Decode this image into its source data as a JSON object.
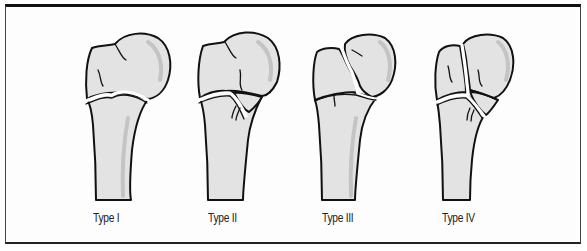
{
  "figure": {
    "types": [
      {
        "label": "Type I"
      },
      {
        "label": "Type II"
      },
      {
        "label": "Type III"
      },
      {
        "label": "Type IV"
      }
    ]
  },
  "colors": {
    "bone_fill": "#e3e3e3",
    "bone_shade": "#c6c6c6",
    "outline": "#111111",
    "frame_border": "#222222",
    "background": "#ffffff"
  }
}
